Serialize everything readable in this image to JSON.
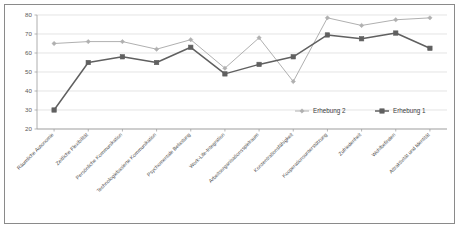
{
  "chart_data": {
    "type": "line",
    "title": "",
    "xlabel": "",
    "ylabel": "",
    "ylim": [
      20,
      80
    ],
    "ytick_step": 10,
    "yticks": [
      20,
      30,
      40,
      50,
      60,
      70,
      80
    ],
    "grid": true,
    "legend_position": "inside-bottom-right",
    "categories": [
      "Räumliche Autonomie",
      "Zeitliche Flexibilität",
      "Persönliche Kommunikation",
      "Technologiebasierte Kommunikation",
      "Psychomentale Belastung",
      "Work-Life-Integration",
      "Arbeitsorganisationsspielraum",
      "Konzentrationsfähigkeit",
      "Kooperationsunterstützung",
      "Zufriedenheit",
      "Wohlbefinden",
      "Attraktivität und Identität"
    ],
    "series": [
      {
        "name": "Erhebung 2",
        "color": "#b0b0b0",
        "marker": "diamond",
        "values": [
          65,
          66,
          66,
          62,
          67,
          52,
          68,
          45,
          78.5,
          74.5,
          77.5,
          78.5
        ]
      },
      {
        "name": "Erhebung 1",
        "color": "#606060",
        "marker": "square",
        "values": [
          30,
          55,
          58,
          55,
          63,
          49,
          54,
          58,
          69.5,
          67.5,
          70.5,
          62.5
        ]
      }
    ]
  },
  "axis": {
    "ytick_labels": [
      "80",
      "70",
      "60",
      "50",
      "40",
      "30",
      "20"
    ]
  },
  "legend": {
    "items": [
      {
        "label": "Erhebung 2"
      },
      {
        "label": "Erhebung 1"
      }
    ]
  }
}
